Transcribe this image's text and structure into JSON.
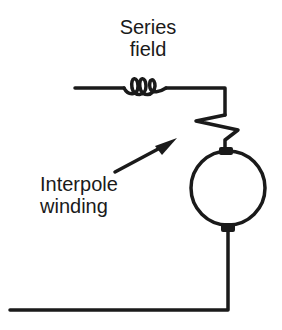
{
  "labels": {
    "series_field": {
      "line1": "Series",
      "line2": "field"
    },
    "interpole_winding": {
      "line1": "Interpole",
      "line2": "winding"
    }
  },
  "components": [
    {
      "name": "series-field-coil",
      "type": "inductor"
    },
    {
      "name": "interpole-winding",
      "type": "zigzag-resistor"
    },
    {
      "name": "armature",
      "type": "circle-with-brushes"
    }
  ],
  "colors": {
    "stroke": "#1a1a1a",
    "background": "#ffffff"
  }
}
